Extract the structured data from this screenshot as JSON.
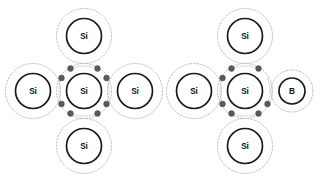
{
  "figure": {
    "background_color": "#ffffff",
    "width": 331,
    "height": 181
  },
  "style": {
    "core_stroke_color": "#1a1a1a",
    "shell_stroke_color": "#b9b9b9",
    "electron_color": "#5a5a5a",
    "bond_arc_color": "#c2c2c2",
    "label_color": "#111111"
  },
  "diagrams": [
    {
      "id": "intrinsic-silicon",
      "name": "intrinsic-silicon-lattice",
      "origin_x": 0,
      "atoms": [
        {
          "role": "center",
          "label": "Si",
          "cx": 84,
          "cy": 91,
          "core_r": 17.5,
          "shell_r": 27.5
        },
        {
          "role": "top",
          "label": "Si",
          "cx": 84,
          "cy": 36,
          "core_r": 17.5,
          "shell_r": 27.5
        },
        {
          "role": "bottom",
          "label": "Si",
          "cx": 84,
          "cy": 146,
          "core_r": 17.5,
          "shell_r": 27.5
        },
        {
          "role": "left",
          "label": "Si",
          "cx": 33,
          "cy": 91,
          "core_r": 17.5,
          "shell_r": 27.5
        },
        {
          "role": "right",
          "label": "Si",
          "cx": 135,
          "cy": 91,
          "core_r": 17.5,
          "shell_r": 27.5
        }
      ],
      "electrons": [
        {
          "pair": "top",
          "position": "top-left",
          "cx": 70.5,
          "cy": 68.5,
          "r": 2.9
        },
        {
          "pair": "top",
          "position": "top-right",
          "cx": 97.5,
          "cy": 68.5,
          "r": 2.9
        },
        {
          "pair": "bottom",
          "position": "bottom-left",
          "cx": 70.5,
          "cy": 113.5,
          "r": 2.9
        },
        {
          "pair": "bottom",
          "position": "bottom-right",
          "cx": 97.5,
          "cy": 113.5,
          "r": 2.9
        },
        {
          "pair": "left",
          "position": "left-top",
          "cx": 61.5,
          "cy": 78.0,
          "r": 2.9
        },
        {
          "pair": "left",
          "position": "left-bottom",
          "cx": 61.5,
          "cy": 104.0,
          "r": 2.9
        },
        {
          "pair": "right",
          "position": "right-top",
          "cx": 106.5,
          "cy": 78.0,
          "r": 2.9
        },
        {
          "pair": "right",
          "position": "right-bottom",
          "cx": 106.5,
          "cy": 104.0,
          "r": 2.9
        }
      ],
      "electron_count": 8,
      "bond_count": 4
    },
    {
      "id": "boron-doped-silicon",
      "name": "boron-doped-silicon-lattice",
      "origin_x": 166,
      "atoms": [
        {
          "role": "center",
          "label": "Si",
          "cx": 79,
          "cy": 91,
          "core_r": 17.5,
          "shell_r": 27.5
        },
        {
          "role": "top",
          "label": "Si",
          "cx": 79,
          "cy": 36,
          "core_r": 17.5,
          "shell_r": 27.5
        },
        {
          "role": "bottom",
          "label": "Si",
          "cx": 79,
          "cy": 146,
          "core_r": 17.5,
          "shell_r": 27.5
        },
        {
          "role": "left",
          "label": "Si",
          "cx": 28,
          "cy": 91,
          "core_r": 17.5,
          "shell_r": 27.5
        },
        {
          "role": "dopant",
          "label": "B",
          "cx": 126,
          "cy": 91,
          "core_r": 13.0,
          "shell_r": 21.0
        }
      ],
      "electrons": [
        {
          "pair": "top",
          "position": "top-left",
          "cx": 65.5,
          "cy": 68.5,
          "r": 2.9
        },
        {
          "pair": "top",
          "position": "top-right",
          "cx": 92.5,
          "cy": 68.5,
          "r": 2.9
        },
        {
          "pair": "bottom",
          "position": "bottom-left",
          "cx": 65.5,
          "cy": 113.5,
          "r": 2.9
        },
        {
          "pair": "bottom",
          "position": "bottom-right",
          "cx": 92.5,
          "cy": 113.5,
          "r": 2.9
        },
        {
          "pair": "left",
          "position": "left-top",
          "cx": 56.5,
          "cy": 78.0,
          "r": 2.9
        },
        {
          "pair": "left",
          "position": "left-bottom",
          "cx": 56.5,
          "cy": 104.0,
          "r": 2.9
        },
        {
          "pair": "right",
          "position": "right-bottom",
          "cx": 101.5,
          "cy": 104.0,
          "r": 2.9
        }
      ],
      "electron_count": 7,
      "bond_count": 4,
      "missing_electron": {
        "position": "right-top",
        "cx": 101.5,
        "cy": 78.0
      }
    }
  ]
}
